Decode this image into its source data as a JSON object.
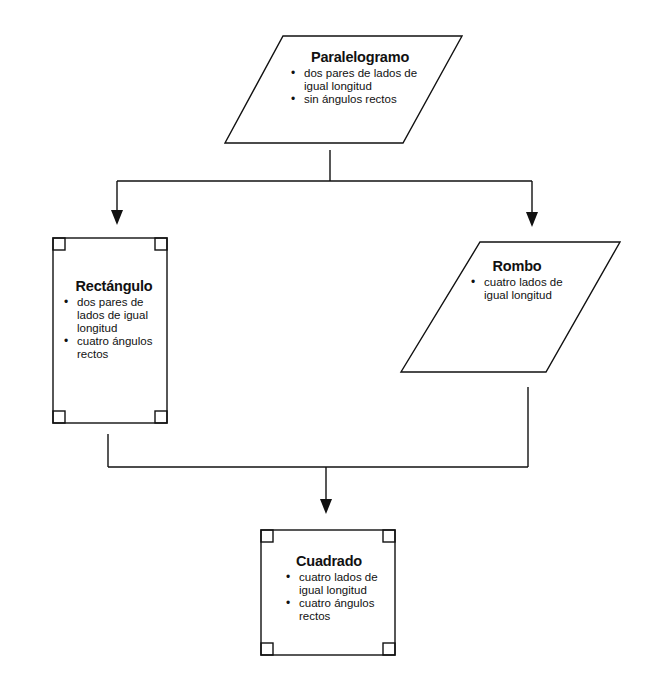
{
  "diagram": {
    "nodes": {
      "paralelogramo": {
        "title": "Paralelogramo",
        "bullets": [
          "dos pares de lados de igual longitud",
          "sin ángulos rectos"
        ],
        "shape": "parallelogram"
      },
      "rectangulo": {
        "title": "Rectángulo",
        "bullets": [
          "dos pares de lados de igual longitud",
          "cuatro ángulos rectos"
        ],
        "shape": "rectangle-with-right-angle-marks"
      },
      "rombo": {
        "title": "Rombo",
        "bullets": [
          "cuatro lados de igual longitud"
        ],
        "shape": "parallelogram"
      },
      "cuadrado": {
        "title": "Cuadrado",
        "bullets": [
          "cuatro lados de igual longitud",
          "cuatro ángulos rectos"
        ],
        "shape": "square-with-right-angle-marks"
      }
    },
    "edges": [
      {
        "from": "Paralelogramo",
        "to": "Rectángulo"
      },
      {
        "from": "Paralelogramo",
        "to": "Rombo"
      },
      {
        "from": "Rectángulo",
        "to": "Cuadrado"
      },
      {
        "from": "Rombo",
        "to": "Cuadrado"
      }
    ],
    "colors": {
      "stroke": "#111111",
      "background": "#ffffff"
    }
  }
}
